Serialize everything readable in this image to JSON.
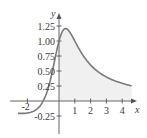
{
  "chart_data": {
    "type": "area",
    "title": "",
    "xlabel": "x",
    "ylabel": "y",
    "function": "(x+1)/(x^2+1)",
    "xlim": [
      -2.6,
      4.9
    ],
    "ylim": [
      -0.45,
      1.4
    ],
    "x_ticks": [
      -2,
      1,
      2,
      3,
      4
    ],
    "x_tick_labels": [
      "-2",
      "1",
      "2",
      "3",
      "4"
    ],
    "y_ticks": [
      -0.25,
      0.25,
      0.5,
      0.75,
      1.0,
      1.25
    ],
    "y_tick_labels": [
      "-0.25",
      "0.25",
      "0.50",
      "0.75",
      "1.00",
      "1.25"
    ],
    "shaded_region": {
      "x_from": 0,
      "x_to": 4.6,
      "color": "#f0f0f0"
    },
    "grid": false,
    "legend": null,
    "series": [
      {
        "name": "curve",
        "color": "#7a7a7a",
        "x": [
          -2.6,
          -2.0,
          -1.5,
          -1.0,
          -0.5,
          0.0,
          0.25,
          0.414,
          0.75,
          1.0,
          1.5,
          2.0,
          2.5,
          3.0,
          3.5,
          4.0,
          4.6
        ],
        "y": [
          -0.2,
          -0.2,
          -0.154,
          0.0,
          0.4,
          1.0,
          1.176,
          1.207,
          1.12,
          1.0,
          0.769,
          0.6,
          0.483,
          0.4,
          0.34,
          0.294,
          0.25
        ]
      }
    ]
  },
  "labels": {
    "x_axis": "x",
    "y_axis": "y",
    "x_ticks": [
      "-2",
      "1",
      "2",
      "3",
      "4"
    ],
    "y_ticks": [
      "1.25",
      "1.00",
      "0.75",
      "0.50",
      "0.25",
      "-0.25"
    ]
  }
}
